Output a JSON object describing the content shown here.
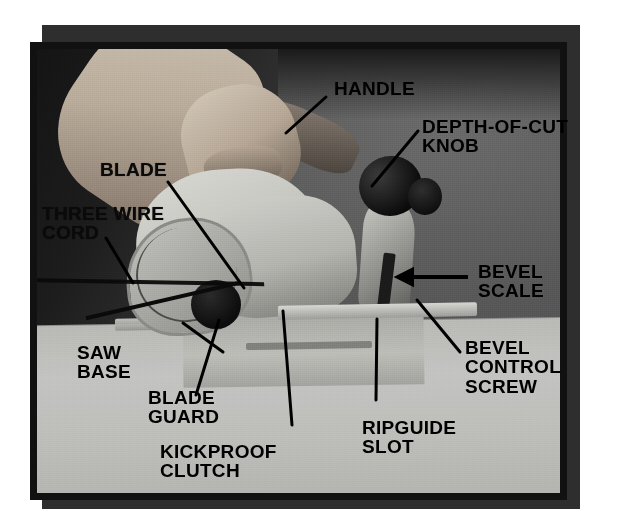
{
  "figure": {
    "photo_style": "black-and-white photograph with printed callout labels"
  },
  "colors": {
    "page_background": "#ffffff",
    "backing_card": "#2e2e2e",
    "photo_frame": "#111111",
    "photo_background_dark": "#4b4b4b",
    "bench_light": "#bdbdba",
    "label_text": "#000000",
    "leader_line": "#000000"
  },
  "labels": [
    {
      "id": "handle",
      "text": "HANDLE",
      "lines": [
        "HANDLE"
      ]
    },
    {
      "id": "depth-of-cut-knob",
      "text": "DEPTH-OF-CUT KNOB",
      "lines": [
        "DEPTH-OF-CUT",
        "KNOB"
      ]
    },
    {
      "id": "blade",
      "text": "BLADE",
      "lines": [
        "BLADE"
      ]
    },
    {
      "id": "three-wire-cord",
      "text": "THREE WIRE CORD",
      "lines": [
        "THREE WIRE",
        "CORD"
      ]
    },
    {
      "id": "bevel-scale",
      "text": "BEVEL SCALE",
      "lines": [
        "BEVEL",
        "SCALE"
      ]
    },
    {
      "id": "saw-base",
      "text": "SAW BASE",
      "lines": [
        "SAW",
        "BASE"
      ]
    },
    {
      "id": "blade-guard",
      "text": "BLADE GUARD",
      "lines": [
        "BLADE",
        "GUARD"
      ]
    },
    {
      "id": "kickproof-clutch",
      "text": "KICKPROOF CLUTCH",
      "lines": [
        "KICKPROOF",
        "CLUTCH"
      ]
    },
    {
      "id": "ripguide-slot",
      "text": "RIPGUIDE SLOT",
      "lines": [
        "RIPGUIDE",
        "SLOT"
      ]
    },
    {
      "id": "bevel-control-screw",
      "text": "BEVEL CONTROL SCREW",
      "lines": [
        "BEVEL",
        "CONTROL",
        "SCREW"
      ]
    }
  ]
}
